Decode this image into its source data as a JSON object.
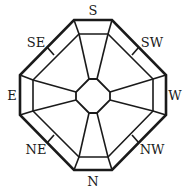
{
  "diagram": {
    "type": "compass-rose-octagon",
    "stroke_color": "#1a1a1a",
    "background": "#ffffff",
    "labels": {
      "top": "S",
      "top_right": "SW",
      "right": "W",
      "bottom_right": "NW",
      "bottom": "N",
      "bottom_left": "NE",
      "left": "E",
      "top_left": "SE"
    }
  }
}
